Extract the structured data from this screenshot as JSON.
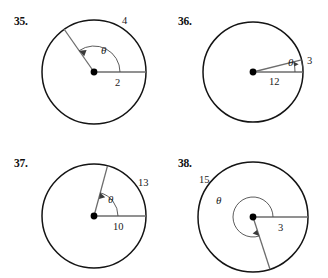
{
  "page": {
    "background_color": "#ffffff",
    "ink_color": "#141414",
    "radius_line_color": "#6d6d6d"
  },
  "problems": [
    {
      "number": "35.",
      "angle_symbol": "θ",
      "arc_label": "4",
      "radius_label": "2",
      "arc_direction": "counterclockwise",
      "angle_kind": "obtuse"
    },
    {
      "number": "36.",
      "angle_symbol": "θ",
      "arc_label": "3",
      "radius_label": "12",
      "arc_direction": "counterclockwise",
      "angle_kind": "acute-small"
    },
    {
      "number": "37.",
      "angle_symbol": "θ",
      "arc_label": "13",
      "radius_label": "10",
      "arc_direction": "counterclockwise",
      "angle_kind": "acute"
    },
    {
      "number": "38.",
      "angle_symbol": "θ",
      "arc_label": "15",
      "radius_label": "3",
      "arc_direction": "counterclockwise",
      "angle_kind": "reflex"
    }
  ]
}
